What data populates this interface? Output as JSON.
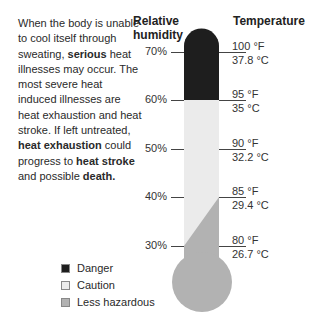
{
  "intro": {
    "segments": [
      {
        "text": "When the body is unable to cool itself through sweating, ",
        "bold": false
      },
      {
        "text": "serious",
        "bold": true
      },
      {
        "text": " heat illnesses may occur. The most severe heat induced illnesses are heat exhaustion and heat stroke. If left untreated, ",
        "bold": false
      },
      {
        "text": "heat exhaustion",
        "bold": true
      },
      {
        "text": " could progress to ",
        "bold": false
      },
      {
        "text": "heat stroke",
        "bold": true
      },
      {
        "text": " and possible ",
        "bold": false
      },
      {
        "text": "death.",
        "bold": true
      }
    ]
  },
  "headers": {
    "humidity_line1": "Relative",
    "humidity_line2": "humidity",
    "temperature": "Temperature"
  },
  "scale": [
    {
      "humidity": "70%",
      "fahrenheit": "100 °F",
      "celsius": "37.8 °C"
    },
    {
      "humidity": "60%",
      "fahrenheit": "95 °F",
      "celsius": "35 °C"
    },
    {
      "humidity": "50%",
      "fahrenheit": "90 °F",
      "celsius": "32.2 °C"
    },
    {
      "humidity": "40%",
      "fahrenheit": "85 °F",
      "celsius": "29.4 °C"
    },
    {
      "humidity": "30%",
      "fahrenheit": "80 °F",
      "celsius": "26.7 °C"
    }
  ],
  "legend": [
    {
      "label": "Danger",
      "color": "#1e1e1e"
    },
    {
      "label": "Caution",
      "color": "#ebebeb"
    },
    {
      "label": "Less hazardous",
      "color": "#b2b2b2"
    }
  ],
  "colors": {
    "danger": "#1e1e1e",
    "caution": "#ebebeb",
    "less_hazardous": "#b2b2b2"
  }
}
